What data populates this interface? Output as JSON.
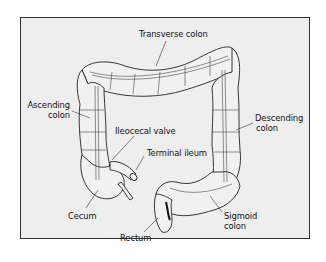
{
  "figure": {
    "background_color": "#eeeeee",
    "border_color": "#333333"
  },
  "labels": {
    "transverse_colon": "Transverse colon",
    "ascending_colon_1": "Ascending",
    "ascending_colon_2": "colon",
    "descending_colon_1": "Descending",
    "descending_colon_2": "colon",
    "ileocecal_valve": "Ileocecal valve",
    "terminal_ileum": "Terminal ileum",
    "cecum": "Cecum",
    "rectum": "Rectum",
    "sigmoid_colon_1": "Sigmoid",
    "sigmoid_colon_2": "colon"
  }
}
